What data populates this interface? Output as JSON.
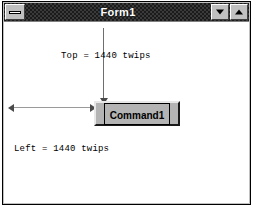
{
  "window": {
    "title": "Form1",
    "sysmenu_icon": "control-menu-box-icon",
    "minimize_icon": "triangle-down-icon",
    "maximize_icon": "triangle-up-icon",
    "titlebar_color": "#1b1b1b",
    "title_color": "#ffffff",
    "face_color": "#c0c0c0",
    "client_color": "#ffffff"
  },
  "annotations": {
    "top": {
      "text": "Top = 1440 twips",
      "arrow": "vertical-arrow-down"
    },
    "left": {
      "text": "Left = 1440 twips",
      "arrow": "horizontal-arrow"
    }
  },
  "control": {
    "command_button_label": "Command1",
    "button_face_color": "#b4b4b4",
    "focus_rect": true
  }
}
